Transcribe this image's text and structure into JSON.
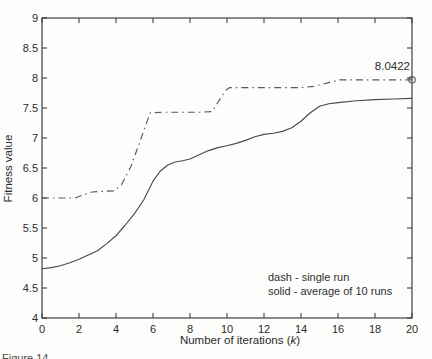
{
  "figure": {
    "caption_fragment": "Figure 14.",
    "annotation_value": "8.0422"
  },
  "chart_data": {
    "type": "line",
    "title": "",
    "xlabel": "Number of iterations (k)",
    "xlabel_parts": {
      "prefix": "Number of iterations (",
      "var": "k",
      "suffix": ")"
    },
    "ylabel": "Fitness value",
    "xlim": [
      0,
      20
    ],
    "ylim": [
      4,
      9
    ],
    "x_ticks": [
      0,
      2,
      4,
      6,
      8,
      10,
      12,
      14,
      16,
      18,
      20
    ],
    "y_ticks": [
      4,
      4.5,
      5,
      5.5,
      6,
      6.5,
      7,
      7.5,
      8,
      8.5,
      9
    ],
    "grid": false,
    "legend_position": "inside-bottom-right",
    "legend_notes": [
      "dash - single run",
      "solid - average of 10 runs"
    ],
    "annotation": {
      "text": "8.0422",
      "x": 20,
      "y": 8.0422
    },
    "end_marker": {
      "shape": "circle",
      "x": 20,
      "y": 7.97
    },
    "series": [
      {
        "name": "single run",
        "style": "dash-dot",
        "points": [
          [
            0,
            6.0
          ],
          [
            1,
            6.0
          ],
          [
            1.8,
            6.0
          ],
          [
            2.2,
            6.05
          ],
          [
            2.7,
            6.1
          ],
          [
            3.2,
            6.11
          ],
          [
            3.9,
            6.12
          ],
          [
            4.3,
            6.22
          ],
          [
            4.8,
            6.52
          ],
          [
            5.3,
            6.95
          ],
          [
            5.85,
            7.42
          ],
          [
            6.5,
            7.43
          ],
          [
            7.5,
            7.43
          ],
          [
            8.5,
            7.43
          ],
          [
            9.2,
            7.44
          ],
          [
            9.6,
            7.64
          ],
          [
            9.95,
            7.8
          ],
          [
            10.15,
            7.84
          ],
          [
            11,
            7.84
          ],
          [
            12,
            7.84
          ],
          [
            13,
            7.84
          ],
          [
            14,
            7.84
          ],
          [
            14.7,
            7.86
          ],
          [
            15.2,
            7.9
          ],
          [
            15.7,
            7.94
          ],
          [
            16.1,
            7.97
          ],
          [
            17,
            7.97
          ],
          [
            18,
            7.97
          ],
          [
            19,
            7.97
          ],
          [
            20,
            7.97
          ]
        ]
      },
      {
        "name": "average of 10 runs",
        "style": "solid",
        "points": [
          [
            0,
            4.82
          ],
          [
            0.5,
            4.84
          ],
          [
            1,
            4.87
          ],
          [
            1.5,
            4.92
          ],
          [
            2,
            4.98
          ],
          [
            2.5,
            5.05
          ],
          [
            3,
            5.12
          ],
          [
            3.5,
            5.24
          ],
          [
            4,
            5.37
          ],
          [
            4.5,
            5.55
          ],
          [
            5,
            5.74
          ],
          [
            5.5,
            5.97
          ],
          [
            6,
            6.28
          ],
          [
            6.4,
            6.45
          ],
          [
            6.8,
            6.55
          ],
          [
            7.2,
            6.6
          ],
          [
            7.6,
            6.62
          ],
          [
            8,
            6.65
          ],
          [
            8.5,
            6.72
          ],
          [
            9,
            6.79
          ],
          [
            9.5,
            6.84
          ],
          [
            10,
            6.87
          ],
          [
            10.5,
            6.91
          ],
          [
            11,
            6.96
          ],
          [
            11.5,
            7.02
          ],
          [
            12,
            7.06
          ],
          [
            12.5,
            7.08
          ],
          [
            13,
            7.11
          ],
          [
            13.5,
            7.17
          ],
          [
            14,
            7.28
          ],
          [
            14.5,
            7.42
          ],
          [
            15,
            7.53
          ],
          [
            15.5,
            7.57
          ],
          [
            16,
            7.59
          ],
          [
            17,
            7.62
          ],
          [
            18,
            7.64
          ],
          [
            19,
            7.65
          ],
          [
            20,
            7.66
          ]
        ]
      }
    ],
    "colors": {
      "axis": "#3f3f3f",
      "dashed_line": "#5a5a5a",
      "solid_line": "#4a4a4a",
      "text": "#2b2b2b",
      "background": "#fdfdfb"
    }
  }
}
